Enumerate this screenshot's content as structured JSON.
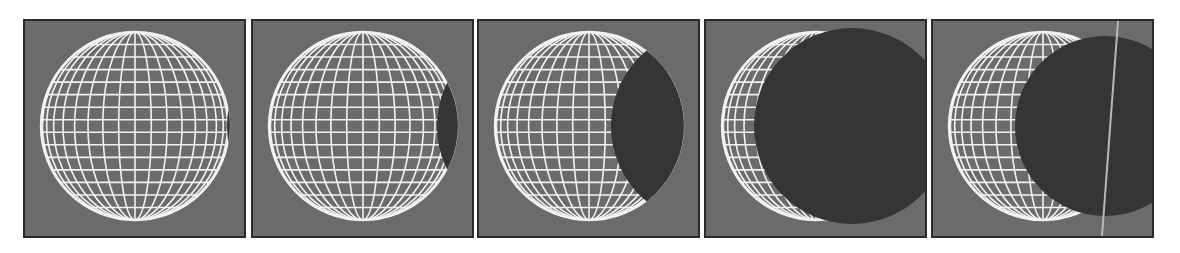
{
  "figure": {
    "colors": {
      "page_background": "#ffffff",
      "panel_background": "#6b6b6b",
      "panel_border": "#2a2a2a",
      "wireframe": "#f2f2f2",
      "occluder": "#353535",
      "guide_line": "#b8b8b8"
    },
    "panels": [
      {
        "index": 1,
        "left": 23,
        "occluder": {
          "dx": 190,
          "dy": 0,
          "r": 98
        },
        "guide_line": false
      },
      {
        "index": 2,
        "left": 251,
        "occluder": {
          "dx": 172,
          "dy": 0,
          "r": 98
        },
        "guide_line": false
      },
      {
        "index": 3,
        "left": 477,
        "occluder": {
          "dx": 120,
          "dy": 0,
          "r": 98
        },
        "guide_line": false
      },
      {
        "index": 4,
        "left": 704,
        "occluder": {
          "dx": 36,
          "dy": 0,
          "r": 98
        },
        "guide_line": false
      },
      {
        "index": 5,
        "left": 931,
        "occluder": {
          "dx": 62,
          "dy": 0,
          "r": 90
        },
        "guide_line": true
      }
    ],
    "globe": {
      "cx": 110,
      "cy": 105,
      "r": 94,
      "meridians": 18,
      "parallels": 15
    }
  }
}
